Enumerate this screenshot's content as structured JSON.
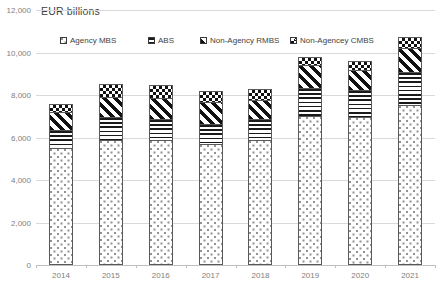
{
  "chart_data": {
    "type": "bar",
    "subtype": "stacked-vertical",
    "title": "EUR billions",
    "xlabel": "",
    "ylabel": "",
    "ylim": [
      0,
      12000
    ],
    "yticks": [
      0,
      2000,
      4000,
      6000,
      8000,
      10000,
      12000
    ],
    "ytick_labels": [
      "0",
      "2,000",
      "4,000",
      "6,000",
      "8,000",
      "10,000",
      "12,000"
    ],
    "grid": true,
    "grid_axis": "y",
    "legend_position": "top-inside",
    "categories": [
      "2014",
      "2015",
      "2016",
      "2017",
      "2018",
      "2019",
      "2020",
      "2021"
    ],
    "series": [
      {
        "name": "Agency MBS",
        "pattern": "sparse-dots",
        "values": [
          5500,
          5900,
          5900,
          5700,
          5900,
          7000,
          6950,
          7550
        ]
      },
      {
        "name": "ABS",
        "pattern": "horizontal-lines",
        "values": [
          850,
          1050,
          950,
          950,
          950,
          1350,
          1300,
          1550
        ]
      },
      {
        "name": "Non-Agency RMBS",
        "pattern": "diagonal-stripes",
        "values": [
          850,
          950,
          1000,
          1000,
          900,
          1050,
          950,
          1100
        ]
      },
      {
        "name": "Non-Agencey CMBS",
        "pattern": "checkerboard",
        "values": [
          400,
          600,
          600,
          550,
          550,
          400,
          400,
          550
        ]
      }
    ],
    "totals": [
      7600,
      8500,
      8450,
      8200,
      8300,
      9800,
      9600,
      10750
    ]
  },
  "legend": {
    "items": [
      {
        "label": "Agency MBS",
        "pattern": "sparse-dots"
      },
      {
        "label": "ABS",
        "pattern": "horizontal-lines"
      },
      {
        "label": "Non-Agency RMBS",
        "pattern": "diagonal-stripes"
      },
      {
        "label": "Non-Agencey CMBS",
        "pattern": "checkerboard"
      }
    ]
  },
  "colors": {
    "background": "#ffffff",
    "gridline": "#d9d9d9",
    "axis_line": "#bfbfbf",
    "tick_text": "#808080",
    "title_text": "#3f3f3f",
    "pattern_ink": "#111111",
    "bar_outline": "#595959"
  }
}
